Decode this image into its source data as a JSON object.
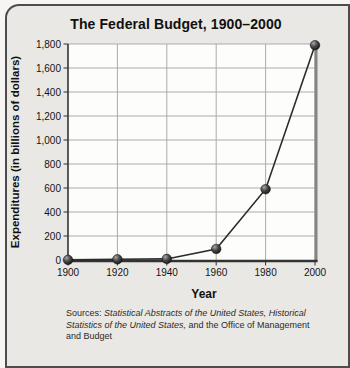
{
  "colors": {
    "card_bg": "#e9e8e4",
    "page_bg": "#f6f5f3",
    "plot_bg": "#fdfdfc",
    "grid": "#ababab",
    "axis": "#333333",
    "shadow": "#848484",
    "line": "#2b2b2b",
    "point_dark": "#0d0d0d",
    "point_mid": "#4a4a4a",
    "point_light": "#a8a8a8",
    "text": "#141414"
  },
  "card": {
    "title": "The Federal Budget, 1900–2000",
    "sources_lines": [
      [
        {
          "t": "Sources: ",
          "i": 0
        },
        {
          "t": "Statistical Abstracts of the United States,",
          "i": 1
        },
        {
          "t": " ",
          "i": 0
        },
        {
          "t": "Historical",
          "i": 1
        }
      ],
      [
        {
          "t": "Statistics of the United States,",
          "i": 1
        },
        {
          "t": " and the Office of Management",
          "i": 0
        }
      ],
      [
        {
          "t": "and Budget",
          "i": 0
        }
      ]
    ]
  },
  "chart_data": {
    "type": "line",
    "title": "The Federal Budget, 1900–2000",
    "xlabel": "Year",
    "ylabel": "Expenditures (in billions of dollars)",
    "series_name": "Federal budget expenditures",
    "x": [
      1900,
      1920,
      1940,
      1960,
      1980,
      2000
    ],
    "values": [
      1,
      6,
      9,
      92,
      590,
      1790
    ],
    "x_tick_labels": [
      "1900",
      "1920",
      "1940",
      "1960",
      "1980",
      "2000"
    ],
    "y_tick_labels": [
      "0",
      "200",
      "400",
      "600",
      "800",
      "1,000",
      "1,200",
      "1,400",
      "1,600",
      "1,800"
    ],
    "y_tick_values": [
      0,
      200,
      400,
      600,
      800,
      1000,
      1200,
      1400,
      1600,
      1800
    ],
    "xlim": [
      1900,
      2000
    ],
    "ylim": [
      0,
      1800
    ],
    "grid": true,
    "legend": "none",
    "marker": "filled-circle"
  }
}
